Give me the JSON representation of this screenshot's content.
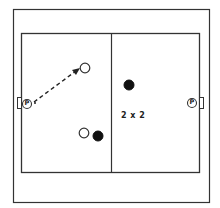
{
  "diagram": {
    "type": "sports-drill",
    "drill_label": "2 x 2",
    "colors": {
      "line": "#333333",
      "background": "#ffffff",
      "team_a_fill": "#ffffff",
      "team_b_fill": "#111111"
    },
    "players": [
      {
        "id": "team-a-player-top",
        "team": "open",
        "x": 85,
        "y": 68
      },
      {
        "id": "team-a-player-bottom",
        "team": "open",
        "x": 84,
        "y": 133
      },
      {
        "id": "team-b-player-right",
        "team": "filled",
        "x": 129,
        "y": 85
      },
      {
        "id": "team-b-player-bottom",
        "team": "filled",
        "x": 98,
        "y": 136
      }
    ],
    "goalkeepers": [
      {
        "id": "goalkeeper-left",
        "label": "P",
        "x": 27,
        "y": 104
      },
      {
        "id": "goalkeeper-right",
        "label": "P",
        "x": 192,
        "y": 103
      }
    ],
    "pass": {
      "from": "goalkeeper-left",
      "to": "team-a-player-top",
      "style": "dashed-arrow"
    }
  }
}
